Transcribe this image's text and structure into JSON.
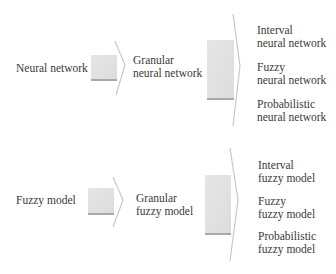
{
  "rows": [
    {
      "source": "Neural network",
      "granular": [
        "Granular",
        "neural network"
      ],
      "outputs": [
        [
          "Interval",
          "neural network"
        ],
        [
          "Fuzzy",
          "neural network"
        ],
        [
          "Probabilistic",
          "neural network"
        ]
      ]
    },
    {
      "source": "Fuzzy model",
      "granular": [
        "Granular",
        "fuzzy model"
      ],
      "outputs": [
        [
          "Interval",
          "fuzzy model"
        ],
        [
          "Fuzzy",
          "fuzzy model"
        ],
        [
          "Probabilistic",
          "fuzzy model"
        ]
      ]
    }
  ],
  "colors": {
    "arrow_fill": "#e3e3e3",
    "arrow_shadow": "#a9a9a9",
    "chevron_line": "#c8c8c8",
    "text": "#3a3a3a"
  }
}
